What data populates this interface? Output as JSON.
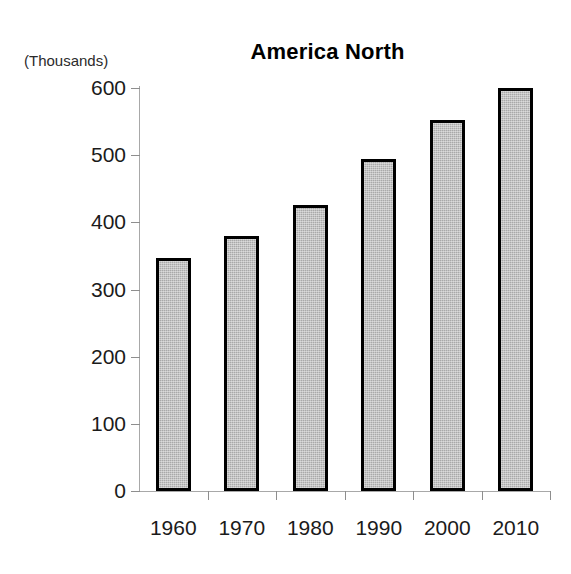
{
  "chart_data": {
    "type": "bar",
    "title": "America North",
    "units_note": "(Thousands)",
    "xlabel": "",
    "ylabel": "",
    "categories": [
      "1960",
      "1970",
      "1980",
      "1990",
      "2000",
      "2010"
    ],
    "values": [
      347,
      380,
      426,
      495,
      553,
      600
    ],
    "ylim": [
      0,
      600
    ],
    "ytick_labels": [
      "600",
      "500",
      "400",
      "300",
      "200",
      "100",
      "0"
    ],
    "ytick_values": [
      600,
      500,
      400,
      300,
      200,
      100,
      0
    ],
    "grid": false,
    "legend": false,
    "series": [
      {
        "name": "America North",
        "values": [
          347,
          380,
          426,
          495,
          553,
          600
        ]
      }
    ],
    "style": {
      "bar_fill": "#a9a9a9",
      "bar_border": "#000000",
      "axis_color": "#a8a8a8",
      "text_color": "#1b1b1b",
      "background": "#ffffff"
    }
  }
}
